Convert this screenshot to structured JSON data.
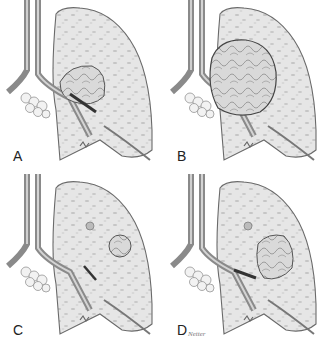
{
  "figure": {
    "panels": [
      {
        "label": "A",
        "lesion": "hilar-tumor-small"
      },
      {
        "label": "B",
        "lesion": "large-bulky-tumor"
      },
      {
        "label": "C",
        "lesion": "peripheral-nodule"
      },
      {
        "label": "D",
        "lesion": "central-tumor-with-nodule"
      }
    ],
    "signature": "Netter"
  },
  "colors": {
    "lung_fill": "#e4e4e4",
    "outline": "#6a6a6a",
    "bronchus": "#8a8a8a",
    "tumor": "#cfcfcf",
    "background": "#ffffff"
  }
}
